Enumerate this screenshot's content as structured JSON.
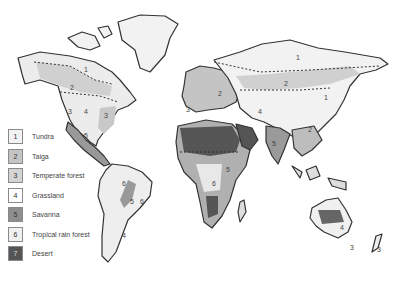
{
  "map": {
    "type": "world biome map",
    "style": "grayscale pencil illustration",
    "colors": {
      "tundra": "#f2f2f2",
      "taiga": "#c4c4c4",
      "temperate_forest": "#cfcfcf",
      "grassland": "#f4f4f4",
      "savanna": "#8e8e8e",
      "tropical_rain_forest": "#e6e6e6",
      "desert": "#555555",
      "outline": "#333333"
    },
    "region_labels": {
      "na_tundra": "1",
      "na_taiga": "2",
      "na_grassland": "4",
      "na_temperate": "3",
      "na_west": "3",
      "ca_savanna": "5",
      "sa_rain": "6",
      "sa_savanna": "5",
      "sa_rain2": "6",
      "sa_grass": "4",
      "eu_taiga": "2",
      "eu_temperate": "3",
      "as_tundra": "1",
      "as_taiga": "2",
      "as_grass": "4",
      "as_east": "1",
      "as_se": "2",
      "in_savanna": "5",
      "af_savanna": "5",
      "af_rain": "6",
      "au_grass": "4",
      "au_3": "3",
      "nz_3": "3"
    }
  },
  "legend": {
    "items": [
      {
        "num": "1",
        "label": "Tundra",
        "color": "#f2f2f2"
      },
      {
        "num": "2",
        "label": "Taiga",
        "color": "#c4c4c4"
      },
      {
        "num": "3",
        "label": "Temperate forest",
        "color": "#d4d4d4"
      },
      {
        "num": "4",
        "label": "Grassland",
        "color": "#ffffff"
      },
      {
        "num": "5",
        "label": "Savanna",
        "color": "#8e8e8e"
      },
      {
        "num": "6",
        "label": "Tropical rain forest",
        "color": "#f0f0f0"
      },
      {
        "num": "7",
        "label": "Desert",
        "color": "#555555"
      }
    ]
  }
}
